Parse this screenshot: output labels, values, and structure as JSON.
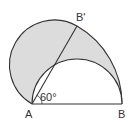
{
  "diagram": {
    "points": {
      "A": {
        "label": "A",
        "x": 32,
        "y": 104
      },
      "B": {
        "label": "B",
        "x": 122,
        "y": 104
      },
      "B_prime": {
        "label": "B'",
        "x": 77,
        "y": 26
      }
    },
    "angle": {
      "label": "60°",
      "vertex": "A",
      "degrees": 60
    },
    "colors": {
      "stroke": "#333333",
      "shade": "#dcdcdc",
      "background": "#ffffff"
    }
  }
}
